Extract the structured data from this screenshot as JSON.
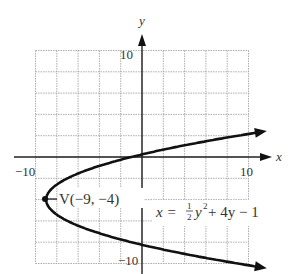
{
  "chart_data": {
    "type": "line",
    "title": "",
    "xlabel": "x",
    "ylabel": "y",
    "xlim": [
      -10,
      10
    ],
    "ylim": [
      -10,
      10
    ],
    "grid": true,
    "grid_step": 2,
    "x_tick_labels": [
      "-10",
      "10"
    ],
    "y_tick_labels": [
      "10",
      "-10"
    ],
    "equation": "x = (1/2)y^2 + 4y - 1",
    "series": [
      {
        "name": "parabola",
        "function": "x = 0.5*y^2 + 4*y - 1",
        "y_range": [
          -14.5,
          6.5
        ],
        "points": [
          {
            "y": 6.5,
            "x": 46.1
          },
          {
            "y": 4,
            "x": 23
          },
          {
            "y": 2,
            "x": 9
          },
          {
            "y": 0,
            "x": -1
          },
          {
            "y": -2,
            "x": -7
          },
          {
            "y": -4,
            "x": -9
          },
          {
            "y": -6,
            "x": -7
          },
          {
            "y": -8,
            "x": -1
          },
          {
            "y": -10,
            "x": 9
          },
          {
            "y": -14.5,
            "x": 46.1
          }
        ]
      }
    ],
    "annotations": [
      {
        "text": "V(-9, -4)",
        "x": -9,
        "y": -4,
        "kind": "vertex"
      }
    ]
  },
  "labels": {
    "x_axis": "x",
    "y_axis": "y",
    "x_min_tick": "−10",
    "x_max_tick": "10",
    "y_max_tick": "10",
    "y_min_tick": "−10",
    "vertex": "V(−9, −4)",
    "eq_lhs": "x = ",
    "eq_frac_num": "1",
    "eq_frac_den": "2",
    "eq_y": "y",
    "eq_exp": "2",
    "eq_rest": " + 4y − 1"
  }
}
